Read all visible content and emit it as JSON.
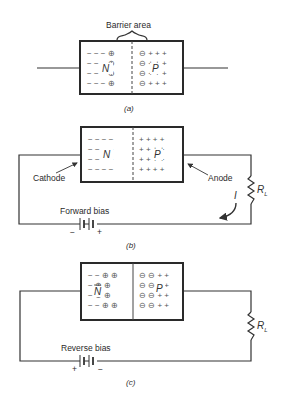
{
  "figure": {
    "panel_a": {
      "caption": "(a)",
      "barrier_label": "Barrier area",
      "n_label": "N",
      "p_label": "P",
      "n_rows": [
        "− − − ⊕",
        "− − − ⊕",
        "− − − ⊕",
        "− − − ⊕"
      ],
      "p_rows": [
        "⊖ + + +",
        "⊖ + + +",
        "⊖ + + +",
        "⊖ + + +"
      ]
    },
    "panel_b": {
      "caption": "(b)",
      "n_label": "N",
      "p_label": "P",
      "n_rows": [
        "− − − −",
        "− − − −",
        "− − − −",
        "− − − −"
      ],
      "p_rows": [
        "+ + + +",
        "+ + + +",
        "+ + + +",
        "+ + + +"
      ],
      "cathode_label": "Cathode",
      "anode_label": "Anode",
      "resistor_label": "R",
      "resistor_sub": "L",
      "current_label": "I",
      "bias_label": "Forward bias",
      "battery_left_sign": "−",
      "battery_right_sign": "+"
    },
    "panel_c": {
      "caption": "(c)",
      "n_label": "N",
      "p_label": "P",
      "n_rows": [
        "− − ⊕ ⊕",
        "− ⊕ ⊕",
        "− ⊕ ⊕",
        "− − ⊕ ⊕"
      ],
      "p_rows": [
        "⊖ ⊖ + +",
        "⊖ ⊖ + +",
        "⊖ ⊖ + +",
        "⊖ ⊖ + +"
      ],
      "resistor_label": "R",
      "resistor_sub": "L",
      "bias_label": "Reverse bias",
      "battery_left_sign": "+",
      "battery_right_sign": "−"
    }
  }
}
